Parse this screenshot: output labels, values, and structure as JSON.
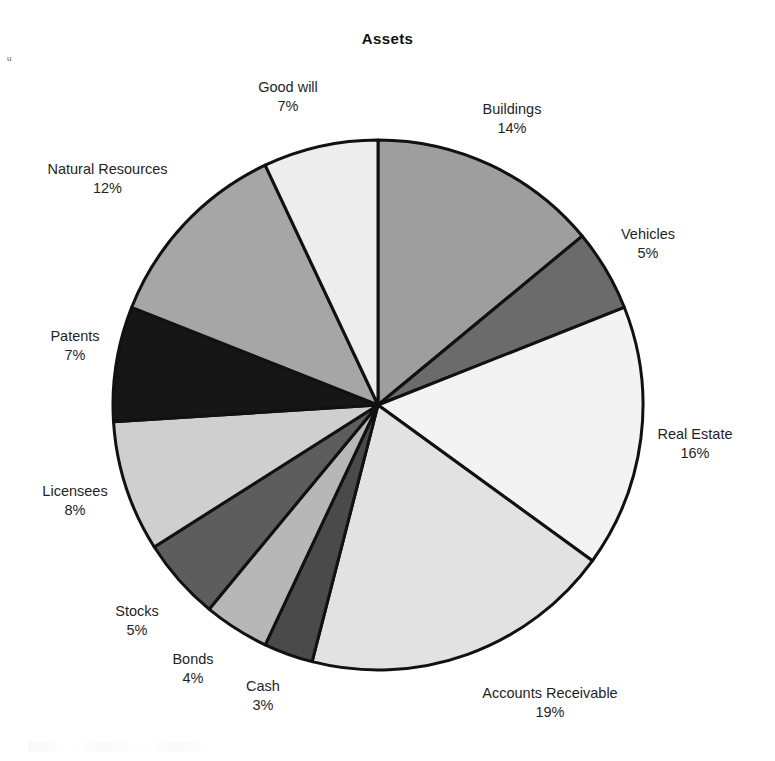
{
  "chart_data": {
    "type": "pie",
    "title": "Assets",
    "subtitle": "",
    "xlabel": "",
    "ylabel": "",
    "legend_position": "none",
    "grid": false,
    "value_unit": "%",
    "start_angle_deg": 0,
    "direction": "clockwise",
    "center": {
      "x": 378,
      "y": 405
    },
    "radius": 265,
    "categories": [
      "Buildings",
      "Vehicles",
      "Real Estate",
      "Accounts Receivable",
      "Cash",
      "Bonds",
      "Stocks",
      "Licensees",
      "Patents",
      "Natural Resources",
      "Good will"
    ],
    "values": [
      14,
      5,
      16,
      19,
      3,
      4,
      5,
      8,
      7,
      12,
      7
    ],
    "labels": [
      "14%",
      "5%",
      "16%",
      "19%",
      "3%",
      "4%",
      "5%",
      "8%",
      "7%",
      "12%",
      "7%"
    ],
    "colors": [
      "#9e9e9e",
      "#6b6b6b",
      "#f3f3f3",
      "#e2e2e2",
      "#4a4a4a",
      "#b7b7b7",
      "#5d5d5d",
      "#cfcfcf",
      "#161616",
      "#a6a6a6",
      "#ededed"
    ],
    "slice_border_color": "#111111",
    "slice_border_width": 3,
    "total": 100
  },
  "slices": [
    {
      "name": "Buildings",
      "pct": "14%"
    },
    {
      "name": "Vehicles",
      "pct": "5%"
    },
    {
      "name": "Real Estate",
      "pct": "16%"
    },
    {
      "name": "Accounts Receivable",
      "pct": "19%"
    },
    {
      "name": "Cash",
      "pct": "3%"
    },
    {
      "name": "Bonds",
      "pct": "4%"
    },
    {
      "name": "Stocks",
      "pct": "5%"
    },
    {
      "name": "Licensees",
      "pct": "8%"
    },
    {
      "name": "Patents",
      "pct": "7%"
    },
    {
      "name": "Natural Resources",
      "pct": "12%"
    },
    {
      "name": "Good will",
      "pct": "7%"
    }
  ],
  "artifacts": {
    "top_left_mark": "u"
  }
}
